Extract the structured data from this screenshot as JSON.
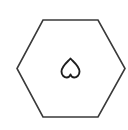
{
  "shape": {
    "type": "hexagon",
    "stroke_color": "#3a3a3a",
    "fill_color": "#ffffff",
    "points": "43,20 98,20 125,68.5 98,117 43,117 17,68.5"
  },
  "icon": {
    "name": "inverted-heart",
    "stroke_color": "#1e1e1e"
  }
}
